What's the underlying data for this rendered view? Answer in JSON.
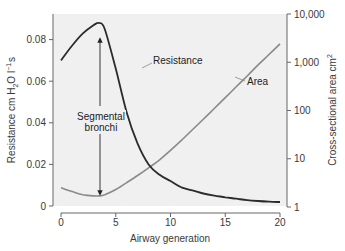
{
  "chart_data": {
    "type": "line",
    "title": "",
    "xlabel": "Airway generation",
    "ylabel": "Resistance cm H2O l-1 s",
    "ylabel_parts": {
      "pre": "Resistance cm H",
      "sub": "2",
      "mid": "O l",
      "sup": "−1",
      "post": "s"
    },
    "y2label": "Cross-sectional area cm2",
    "y2label_parts": {
      "pre": "Cross-sectional area cm",
      "sup": "2"
    },
    "xlim": [
      0,
      20
    ],
    "ylim": [
      0,
      0.09
    ],
    "y2lim": [
      1,
      10000
    ],
    "y2scale": "log",
    "x_ticks": [
      "0",
      "5",
      "10",
      "15",
      "20"
    ],
    "y_ticks": [
      "0",
      "0.02",
      "0.04",
      "0.06",
      "0.08"
    ],
    "y2_ticks": [
      "1",
      "10",
      "100",
      "1,000",
      "10,000"
    ],
    "grid": false,
    "legend": "none (curves labeled inline)",
    "series": [
      {
        "name": "Resistance",
        "axis": "left",
        "color": "#2b2b2b",
        "x": [
          0,
          1,
          2,
          3,
          3.5,
          4,
          5,
          6,
          7,
          8,
          9,
          10,
          11,
          12,
          13,
          14,
          15,
          16,
          17,
          18,
          19,
          20
        ],
        "values": [
          0.07,
          0.077,
          0.083,
          0.087,
          0.088,
          0.085,
          0.066,
          0.045,
          0.03,
          0.02,
          0.015,
          0.012,
          0.009,
          0.0075,
          0.006,
          0.005,
          0.0042,
          0.0035,
          0.0028,
          0.0024,
          0.0021,
          0.0019
        ]
      },
      {
        "name": "Area",
        "axis": "right",
        "color": "#8a8a8a",
        "x": [
          0,
          1,
          2,
          3,
          3.5,
          4,
          5,
          6,
          7,
          8,
          9,
          10,
          11,
          12,
          13,
          14,
          15,
          16,
          17,
          18,
          19,
          20
        ],
        "values": [
          2.5,
          2.1,
          1.8,
          1.7,
          1.7,
          1.8,
          2.3,
          3.2,
          4.5,
          6.5,
          9.5,
          15,
          24,
          40,
          66,
          110,
          185,
          310,
          520,
          880,
          1450,
          2400
        ]
      }
    ],
    "annotations": [
      {
        "text": "Resistance",
        "target": "Resistance curve",
        "x": 7.7,
        "y_left": 0.076
      },
      {
        "text": "Area",
        "target": "Area curve",
        "x": 15.5,
        "y_right": 250
      },
      {
        "text": "Segmental bronchi",
        "x": 3.5,
        "arrows": [
          "up to resistance peak",
          "down to area minimum"
        ]
      }
    ]
  },
  "labels": {
    "resistance": "Resistance",
    "area": "Area",
    "segmental_line1": "Segmental",
    "segmental_line2": "bronchi"
  }
}
